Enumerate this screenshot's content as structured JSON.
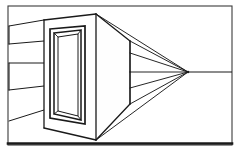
{
  "figure": {
    "type": "line-drawing",
    "canvas": {
      "width": 240,
      "height": 155,
      "background": "#ffffff"
    },
    "colors": {
      "ink": "#1a1a1a",
      "ink_soft": "#3b3b3b",
      "paper": "#ffffff",
      "face_fill": "#fefefe",
      "shadow_fill": "#f7f7f7"
    },
    "border_frame": {
      "name": "image-border",
      "x": 8,
      "y": 6,
      "width": 224,
      "height": 139,
      "stroke": "#3b3b3b",
      "stroke_width": 1.1,
      "bottom_rule": {
        "x1": 8,
        "y1": 143.5,
        "x2": 232,
        "y2": 143.5,
        "stroke": "#1a1a1a",
        "stroke_width": 2.6
      }
    },
    "vanishing_point": {
      "label": "VP",
      "x": 188,
      "y": 72
    },
    "horizon_line": {
      "x1": 8,
      "y1": 72,
      "x2": 232,
      "y2": 72
    },
    "box": {
      "front_face": {
        "name": "box-front-face",
        "points": "44,20 96,14 96,140 44,128",
        "stroke_width": 1.3
      },
      "top_face": {
        "name": "box-top-face",
        "points": "44,20 96,14 130,41 130,41",
        "stroke_width": 1.3
      },
      "side_face": {
        "name": "box-right-side-face",
        "points": "96,14 130,41 130,104 96,140",
        "stroke_width": 1.3
      },
      "edges": [
        {
          "name": "edge-front-left-vertical",
          "x1": 44,
          "y1": 20,
          "x2": 44,
          "y2": 128
        },
        {
          "name": "edge-front-right-vertical",
          "x1": 96,
          "y1": 14,
          "x2": 96,
          "y2": 140
        },
        {
          "name": "edge-back-right-vertical",
          "x1": 130,
          "y1": 41,
          "x2": 130,
          "y2": 104
        },
        {
          "name": "edge-top-front",
          "x1": 44,
          "y1": 20,
          "x2": 96,
          "y2": 14
        },
        {
          "name": "edge-top-receding",
          "x1": 96,
          "y1": 14,
          "x2": 130,
          "y2": 41
        },
        {
          "name": "edge-bottom-front",
          "x1": 44,
          "y1": 128,
          "x2": 96,
          "y2": 140
        },
        {
          "name": "edge-bottom-receding",
          "x1": 96,
          "y1": 140,
          "x2": 130,
          "y2": 104
        }
      ]
    },
    "opening": {
      "outer_rect": {
        "name": "opening-outer-frame",
        "points": "50,29 85,26 85,124 50,118"
      },
      "inner_rect": {
        "name": "opening-inner-frame",
        "points": "54,33 81,30 81,120 54,114"
      },
      "recess_back": {
        "name": "opening-recessed-back-panel",
        "points": "58,37 78,34 78,116 58,111"
      },
      "recess_connectors": [
        {
          "name": "recess-connector-top-left",
          "x1": 54,
          "y1": 33,
          "x2": 58,
          "y2": 37
        },
        {
          "name": "recess-connector-top-right",
          "x1": 81,
          "y1": 30,
          "x2": 78,
          "y2": 34
        },
        {
          "name": "recess-connector-bottom-left",
          "x1": 54,
          "y1": 114,
          "x2": 58,
          "y2": 111
        },
        {
          "name": "recess-connector-bottom-right",
          "x1": 81,
          "y1": 120,
          "x2": 78,
          "y2": 116
        }
      ]
    },
    "left_convergence_lines": [
      {
        "name": "left-line-1",
        "x1": 9,
        "y1": 26,
        "x2": 44,
        "y2": 20
      },
      {
        "name": "left-line-2",
        "x1": 9,
        "y1": 44,
        "x2": 44,
        "y2": 41
      },
      {
        "name": "left-line-3",
        "x1": 9,
        "y1": 63,
        "x2": 44,
        "y2": 63
      },
      {
        "name": "left-line-4",
        "x1": 9,
        "y1": 90,
        "x2": 44,
        "y2": 86
      },
      {
        "name": "left-line-5",
        "x1": 9,
        "y1": 121,
        "x2": 44,
        "y2": 110
      }
    ],
    "left_vertical_ticks": [
      {
        "name": "left-tick-upper",
        "x1": 9,
        "y1": 26,
        "x2": 9,
        "y2": 44
      },
      {
        "name": "left-tick-mid",
        "x1": 9,
        "y1": 63,
        "x2": 9,
        "y2": 90
      }
    ],
    "right_convergence_lines": [
      {
        "name": "vp-ray-top-edge",
        "x1": 130,
        "y1": 41,
        "x2": 188,
        "y2": 72
      },
      {
        "name": "vp-ray-upper-inner",
        "x1": 130,
        "y1": 53,
        "x2": 188,
        "y2": 72
      },
      {
        "name": "vp-ray-center",
        "x1": 130,
        "y1": 72,
        "x2": 188,
        "y2": 72
      },
      {
        "name": "vp-ray-lower-inner",
        "x1": 130,
        "y1": 88,
        "x2": 188,
        "y2": 72
      },
      {
        "name": "vp-ray-bottom-edge",
        "x1": 130,
        "y1": 104,
        "x2": 188,
        "y2": 72
      },
      {
        "name": "vp-ray-from-top-corner",
        "x1": 96,
        "y1": 14,
        "x2": 188,
        "y2": 72
      },
      {
        "name": "vp-ray-from-bottom-corner",
        "x1": 96,
        "y1": 140,
        "x2": 188,
        "y2": 72
      }
    ],
    "right_verticals": [
      {
        "name": "right-vertical-upper",
        "x1": 130,
        "y1": 41,
        "x2": 130,
        "y2": 72
      },
      {
        "name": "right-vertical-lower",
        "x1": 130,
        "y1": 72,
        "x2": 130,
        "y2": 104
      }
    ],
    "horizon_tail": {
      "name": "horizon-tail-right",
      "x1": 188,
      "y1": 72,
      "x2": 232,
      "y2": 72
    }
  }
}
